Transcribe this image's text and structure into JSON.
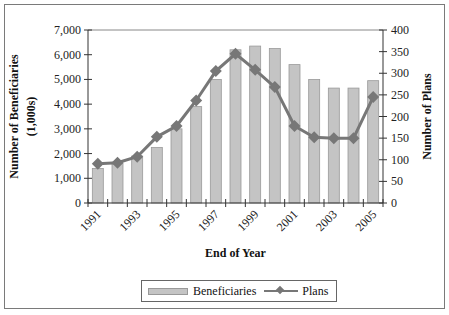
{
  "chart_data": {
    "type": "bar+line",
    "title": "",
    "xlabel": "End of Year",
    "ylabel_left": "Number of Beneficiaries (1,000s)",
    "ylabel_left_lines": [
      "Number of Beneficiaries",
      "(1,000s)"
    ],
    "ylabel_right": "Number of Plans",
    "categories": [
      "1991",
      "1992",
      "1993",
      "1994",
      "1995",
      "1996",
      "1997",
      "1998",
      "1999",
      "2000",
      "2001",
      "2002",
      "2003",
      "2004",
      "2005"
    ],
    "x_tick_labels": [
      "1991",
      "1993",
      "1995",
      "1997",
      "1999",
      "2001",
      "2003",
      "2005"
    ],
    "series": [
      {
        "name": "Beneficiaries",
        "type": "bar",
        "axis": "left",
        "color": "#c4c4c4",
        "values": [
          1400,
          1600,
          1900,
          2250,
          3000,
          3900,
          5000,
          6200,
          6350,
          6250,
          5600,
          5000,
          4650,
          4650,
          4950
        ]
      },
      {
        "name": "Plans",
        "type": "line",
        "axis": "right",
        "color": "#777777",
        "marker": "diamond",
        "values": [
          91,
          93,
          107,
          153,
          178,
          237,
          305,
          345,
          308,
          268,
          178,
          152,
          150,
          150,
          245
        ]
      }
    ],
    "ylim_left": [
      0,
      7000
    ],
    "yticks_left": [
      "0",
      "1,000",
      "2,000",
      "3,000",
      "4,000",
      "5,000",
      "6,000",
      "7,000"
    ],
    "ylim_right": [
      0,
      400
    ],
    "yticks_right": [
      "0",
      "50",
      "100",
      "150",
      "200",
      "250",
      "300",
      "350",
      "400"
    ],
    "grid": false,
    "legend_position": "bottom"
  },
  "legend": {
    "items": [
      {
        "label": "Beneficiaries"
      },
      {
        "label": "Plans"
      }
    ]
  }
}
